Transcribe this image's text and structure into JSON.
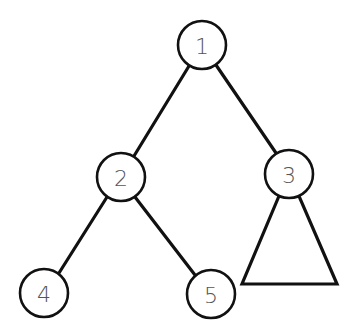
{
  "diagram": {
    "type": "binary-tree",
    "colors": {
      "stroke": "#111111",
      "label": "#555555",
      "background": "#ffffff"
    },
    "nodes": [
      {
        "id": "n1",
        "label": "1",
        "cx": 202,
        "cy": 45,
        "r": 24
      },
      {
        "id": "n2",
        "label": "2",
        "cx": 121,
        "cy": 177,
        "r": 24
      },
      {
        "id": "n3",
        "label": "3",
        "cx": 289,
        "cy": 174,
        "r": 24
      },
      {
        "id": "n4",
        "label": "4",
        "cx": 44,
        "cy": 293,
        "r": 24
      },
      {
        "id": "n5",
        "label": "5",
        "cx": 211,
        "cy": 294,
        "r": 24
      }
    ],
    "edges": [
      {
        "from": "1",
        "to": "2"
      },
      {
        "from": "1",
        "to": "3"
      },
      {
        "from": "2",
        "to": "4"
      },
      {
        "from": "2",
        "to": "5"
      }
    ],
    "subtrees": [
      {
        "attached_to": "3",
        "shape": "triangle",
        "description": "subtree of node 3"
      }
    ]
  }
}
